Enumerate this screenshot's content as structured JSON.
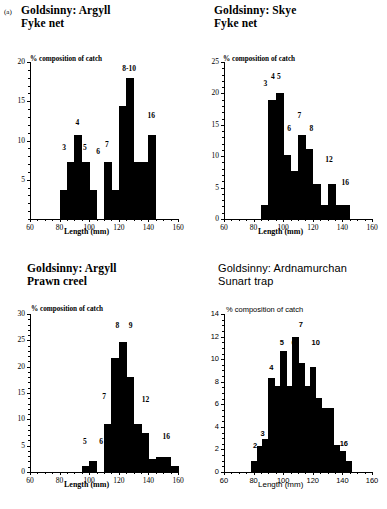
{
  "figure": {
    "label": "(a)"
  },
  "axis_common": {
    "xlabel": "Length (mm)",
    "ylabel": "% composition of catch"
  },
  "panels": [
    {
      "id": "a",
      "title": "Goldsinny: Argyll\nFyke net",
      "chart_data": {
        "type": "bar",
        "title": "Goldsinny: Argyll Fyke net",
        "xlabel": "Length (mm)",
        "ylabel": "% composition of catch",
        "xlim": [
          60,
          160
        ],
        "ylim": [
          0,
          20
        ],
        "yticks": [
          5,
          10,
          15,
          20
        ],
        "xticks": [
          60,
          80,
          100,
          120,
          140,
          160
        ],
        "xtick_minor_step": 5,
        "ytick_minor_step": 1,
        "grid": false,
        "bin_width": 5,
        "bins": [
          80,
          85,
          90,
          95,
          100,
          110,
          115,
          120,
          125,
          130,
          135,
          140
        ],
        "values": [
          3.7,
          7.2,
          10.7,
          7.2,
          3.7,
          7.2,
          3.7,
          14.4,
          18.0,
          7.2,
          7.2,
          10.7
        ],
        "annotations": [
          {
            "text": "3",
            "x": 83,
            "y": 8.9
          },
          {
            "text": "4",
            "x": 92,
            "y": 12.1
          },
          {
            "text": "5",
            "x": 97,
            "y": 8.9
          },
          {
            "text": "6",
            "x": 106,
            "y": 8.4
          },
          {
            "text": "7",
            "x": 112,
            "y": 9.3
          },
          {
            "text": "8-10",
            "x": 127,
            "y": 19.0
          },
          {
            "text": "16",
            "x": 142,
            "y": 13.0
          }
        ]
      }
    },
    {
      "id": "b",
      "title": "Goldsinny: Skye\nFyke net",
      "chart_data": {
        "type": "bar",
        "title": "Goldsinny: Skye Fyke net",
        "xlabel": "Length (mm)",
        "ylabel": "% composition of catch",
        "xlim": [
          60,
          160
        ],
        "ylim": [
          0,
          25
        ],
        "yticks": [
          0,
          5,
          10,
          15,
          20,
          25
        ],
        "xticks": [
          60,
          80,
          100,
          120,
          140,
          160
        ],
        "xtick_minor_step": 5,
        "ytick_minor_step": 1,
        "grid": false,
        "bin_width": 5,
        "bins": [
          85,
          90,
          95,
          100,
          105,
          110,
          115,
          120,
          125,
          130,
          135,
          140
        ],
        "values": [
          2.3,
          19.0,
          20.0,
          10.2,
          7.7,
          13.3,
          11.1,
          5.5,
          2.3,
          5.5,
          2.3,
          2.3
        ],
        "annotations": [
          {
            "text": "3",
            "x": 88,
            "y": 21.3
          },
          {
            "text": "4",
            "x": 93,
            "y": 22.5
          },
          {
            "text": "5",
            "x": 97,
            "y": 22.5
          },
          {
            "text": "6",
            "x": 104,
            "y": 14.2
          },
          {
            "text": "7",
            "x": 111,
            "y": 16.3
          },
          {
            "text": "8",
            "x": 119,
            "y": 14.2
          },
          {
            "text": "12",
            "x": 131,
            "y": 9.2
          },
          {
            "text": "16",
            "x": 142,
            "y": 5.6
          }
        ]
      }
    },
    {
      "id": "c",
      "title": "Goldsinny: Argyll\nPrawn creel",
      "chart_data": {
        "type": "bar",
        "title": "Goldsinny: Argyll Prawn creel",
        "xlabel": "Length (mm)",
        "ylabel": "% composition of catch",
        "xlim": [
          60,
          160
        ],
        "ylim": [
          0,
          30
        ],
        "yticks": [
          0,
          5,
          10,
          15,
          20,
          25,
          30
        ],
        "xticks": [
          60,
          80,
          100,
          120,
          140,
          160
        ],
        "xtick_minor_step": 5,
        "ytick_minor_step": 1,
        "grid": false,
        "bin_width": 5,
        "bins": [
          95,
          100,
          110,
          115,
          120,
          125,
          130,
          135,
          140,
          145,
          150,
          155
        ],
        "values": [
          1.1,
          2.1,
          9.2,
          21.6,
          24.6,
          18.0,
          9.2,
          7.4,
          2.5,
          2.9,
          2.9,
          1.1
        ],
        "annotations": [
          {
            "text": "5",
            "x": 97,
            "y": 5.5
          },
          {
            "text": "6",
            "x": 108,
            "y": 5.5
          },
          {
            "text": "7",
            "x": 110,
            "y": 14.0
          },
          {
            "text": "8",
            "x": 119,
            "y": 27.5
          },
          {
            "text": "9",
            "x": 128,
            "y": 27.5
          },
          {
            "text": "12",
            "x": 138,
            "y": 13.5
          },
          {
            "text": "16",
            "x": 152,
            "y": 6.5
          }
        ]
      }
    },
    {
      "id": "d",
      "title": "Goldsinny: Ardnamurchan\nSunart trap",
      "chart_data": {
        "type": "bar",
        "title": "Goldsinny: Ardnamurchan Sunart trap",
        "xlabel": "Length (mm)",
        "ylabel": "% composition of catch",
        "xlim": [
          60,
          160
        ],
        "ylim": [
          0,
          14
        ],
        "yticks": [
          0,
          2,
          4,
          6,
          8,
          10,
          12,
          14
        ],
        "xticks": [
          60,
          80,
          100,
          120,
          140,
          160
        ],
        "xtick_minor_step": 5,
        "ytick_minor_step": 0.5,
        "grid": false,
        "bin_width": 4,
        "bins": [
          78,
          82,
          86,
          90,
          94,
          98,
          102,
          106,
          110,
          114,
          118,
          122,
          126,
          130,
          134,
          138,
          142
        ],
        "values": [
          1.0,
          2.3,
          2.9,
          8.3,
          7.6,
          10.7,
          7.6,
          12.0,
          9.7,
          7.6,
          9.3,
          6.6,
          5.7,
          5.7,
          2.4,
          1.9,
          1.0
        ],
        "annotations": [
          {
            "text": "2",
            "x": 81,
            "y": 2.2
          },
          {
            "text": "3",
            "x": 86,
            "y": 3.3
          },
          {
            "text": "4",
            "x": 92,
            "y": 9.1
          },
          {
            "text": "5",
            "x": 99,
            "y": 11.3
          },
          {
            "text": "6",
            "x": 107,
            "y": 11.3
          },
          {
            "text": "7",
            "x": 112,
            "y": 12.9
          },
          {
            "text": "10",
            "x": 122,
            "y": 11.3
          },
          {
            "text": "16",
            "x": 141,
            "y": 2.4
          }
        ]
      }
    }
  ]
}
